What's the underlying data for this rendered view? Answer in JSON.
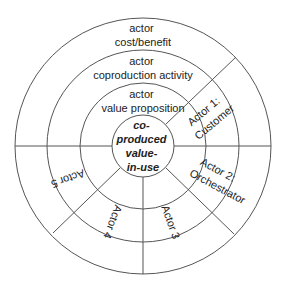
{
  "diagram": {
    "center": {
      "lines": [
        "co-",
        "produced",
        "value-",
        "in-use"
      ]
    },
    "rings": [
      {
        "name": "value-proposition",
        "lines": [
          "actor",
          "value proposition"
        ]
      },
      {
        "name": "coproduction-activity",
        "lines": [
          "actor",
          "coproduction activity"
        ]
      },
      {
        "name": "cost-benefit",
        "lines": [
          "actor",
          "cost/benefit"
        ]
      }
    ],
    "actors": [
      {
        "label_lines": [
          "Actor 1:",
          "Customer"
        ]
      },
      {
        "label_lines": [
          "Actor 2:",
          "Orchestrator"
        ]
      },
      {
        "label_lines": [
          "Actor 3"
        ]
      },
      {
        "label_lines": [
          "Actor 4"
        ]
      },
      {
        "label_lines": [
          "Actor 5"
        ]
      }
    ],
    "colors": {
      "line": "#555555",
      "text": "#222222",
      "background": "#ffffff"
    }
  }
}
